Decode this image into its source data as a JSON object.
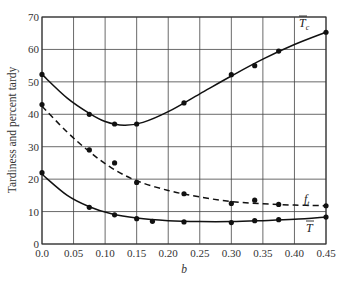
{
  "chart_data": {
    "type": "line",
    "title": "",
    "xlabel": "b",
    "ylabel": "Tardiness and percent tardy",
    "xlim": [
      0.0,
      0.45
    ],
    "ylim": [
      0,
      70
    ],
    "grid": true,
    "legend_position": "inline labels at right end of curves",
    "x_ticks": [
      "0.0",
      "0.05",
      "0.10",
      "0.15",
      "0.20",
      "0.25",
      "0.30",
      "0.35",
      "0.40",
      "0.45"
    ],
    "y_ticks": [
      "0",
      "10",
      "20",
      "30",
      "40",
      "50",
      "60",
      "70"
    ],
    "series": [
      {
        "name": "T̄c",
        "label_main": "T",
        "label_sub": "c",
        "overbar": true,
        "style": "solid",
        "points": [
          [
            0.0,
            52.3
          ],
          [
            0.075,
            40.0
          ],
          [
            0.115,
            37.0
          ],
          [
            0.15,
            37.0
          ],
          [
            0.225,
            43.5
          ],
          [
            0.3,
            52.2
          ],
          [
            0.337,
            55.0
          ],
          [
            0.375,
            59.5
          ],
          [
            0.45,
            65.3
          ]
        ],
        "curve": [
          [
            0.0,
            52.3
          ],
          [
            0.04,
            45.0
          ],
          [
            0.075,
            40.3
          ],
          [
            0.1,
            37.8
          ],
          [
            0.13,
            36.6
          ],
          [
            0.16,
            37.5
          ],
          [
            0.2,
            40.8
          ],
          [
            0.25,
            46.3
          ],
          [
            0.3,
            51.8
          ],
          [
            0.35,
            57.0
          ],
          [
            0.4,
            61.5
          ],
          [
            0.45,
            65.3
          ]
        ]
      },
      {
        "name": "f_t",
        "label_main": "f",
        "label_sub": "t",
        "overbar": false,
        "style": "dashed",
        "points": [
          [
            0.0,
            43.0
          ],
          [
            0.075,
            29.0
          ],
          [
            0.115,
            25.0
          ],
          [
            0.15,
            19.0
          ],
          [
            0.225,
            15.5
          ],
          [
            0.3,
            12.5
          ],
          [
            0.337,
            13.5
          ],
          [
            0.375,
            12.2
          ],
          [
            0.45,
            11.8
          ]
        ],
        "curve": [
          [
            0.0,
            42.5
          ],
          [
            0.04,
            34.5
          ],
          [
            0.075,
            28.5
          ],
          [
            0.11,
            23.5
          ],
          [
            0.15,
            19.5
          ],
          [
            0.2,
            16.5
          ],
          [
            0.25,
            14.5
          ],
          [
            0.3,
            13.1
          ],
          [
            0.35,
            12.4
          ],
          [
            0.4,
            12.0
          ],
          [
            0.45,
            11.8
          ]
        ]
      },
      {
        "name": "T̄",
        "label_main": "T",
        "label_sub": "",
        "overbar": true,
        "style": "solid",
        "points": [
          [
            0.0,
            22.0
          ],
          [
            0.075,
            11.3
          ],
          [
            0.115,
            9.0
          ],
          [
            0.15,
            7.8
          ],
          [
            0.175,
            7.0
          ],
          [
            0.225,
            6.8
          ],
          [
            0.3,
            6.6
          ],
          [
            0.337,
            7.2
          ],
          [
            0.375,
            7.5
          ],
          [
            0.45,
            8.3
          ]
        ],
        "curve": [
          [
            0.0,
            21.5
          ],
          [
            0.04,
            15.0
          ],
          [
            0.075,
            11.5
          ],
          [
            0.11,
            9.3
          ],
          [
            0.15,
            8.0
          ],
          [
            0.2,
            7.2
          ],
          [
            0.25,
            6.9
          ],
          [
            0.3,
            6.9
          ],
          [
            0.35,
            7.2
          ],
          [
            0.4,
            7.6
          ],
          [
            0.45,
            8.3
          ]
        ]
      }
    ]
  },
  "labels": {
    "xlabel": "b",
    "ylabel": "Tardiness and percent tardy"
  }
}
